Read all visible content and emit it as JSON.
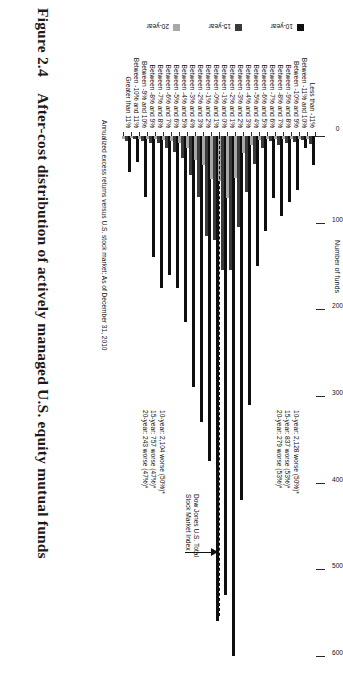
{
  "figure": {
    "number": "Figure 2.4",
    "title": "After-cost distribution of actively managed U.S. equity mutual funds"
  },
  "chart_data": {
    "type": "bar",
    "orientation": "horizontal",
    "title": "After-cost distribution of actively managed U.S. equity mutual funds",
    "xlabel": "Number of funds",
    "ylabel": "Annualized excess returns versus U.S. stock market: As of December 31, 2010",
    "xlim": [
      0,
      600
    ],
    "xticks": [
      0,
      100,
      200,
      300,
      400,
      500,
      600
    ],
    "grid": false,
    "legend_position": "left",
    "categories": [
      "Less than -11%",
      "Between -11% and 10%",
      "Between -10% and 9%",
      "Between -9% and 8%",
      "Between -8% and 7%",
      "Between -7% and 6%",
      "Between -6% and 5%",
      "Between -5% and 4%",
      "Between -4% and 3%",
      "Between -3% and 2%",
      "Between -2% and 1%",
      "Between -1% and 0%",
      "Between -0% and 1%",
      "Between -1% and 2%",
      "Between -2% and 3%",
      "Between -3% and 4%",
      "Between -4% and 5%",
      "Between -5% and 6%",
      "Between -6% and 7%",
      "Between -7% and 8%",
      "Between -8% and 9%",
      "Between -9% and 10%",
      "Between -10% and 11%",
      "Greater than 11%"
    ],
    "series": [
      {
        "name": "10-year",
        "color": "#0f0f0f",
        "values": [
          34,
          14,
          62,
          76,
          92,
          72,
          110,
          150,
          310,
          420,
          600,
          530,
          560,
          375,
          330,
          290,
          215,
          175,
          160,
          175,
          140,
          70,
          30,
          42
        ]
      },
      {
        "name": "15-year",
        "color": "#3a3a3a",
        "values": [
          9,
          5,
          7,
          8,
          10,
          6,
          14,
          32,
          65,
          105,
          155,
          155,
          120,
          115,
          70,
          45,
          25,
          18,
          14,
          8,
          8,
          6,
          4,
          6
        ]
      },
      {
        "name": "20-year",
        "color": "#a8a8a8",
        "values": [
          4,
          3,
          3,
          3,
          4,
          3,
          5,
          10,
          20,
          48,
          72,
          52,
          50,
          34,
          28,
          14,
          8,
          6,
          5,
          4,
          4,
          3,
          2,
          3
        ]
      }
    ],
    "benchmark": {
      "label_line1": "Dow Jones U.S. Total",
      "label_line2": "Stock Market Index",
      "between_categories": [
        "Between -1% and 0%",
        "Between -0% and 1%"
      ]
    },
    "annotations": [
      {
        "id": "above-benchmark",
        "lines": [
          "10-year: 2,128 worse (50%)*",
          "15-year: 837 worse (53%)*",
          "20-year: 279 worse (53%)*"
        ]
      },
      {
        "id": "below-benchmark",
        "lines": [
          "10-year: 2,104 worse (50%)*",
          "15-year: 757 worse (47%)*",
          "20-year: 243 worse (47%)*"
        ]
      }
    ]
  }
}
